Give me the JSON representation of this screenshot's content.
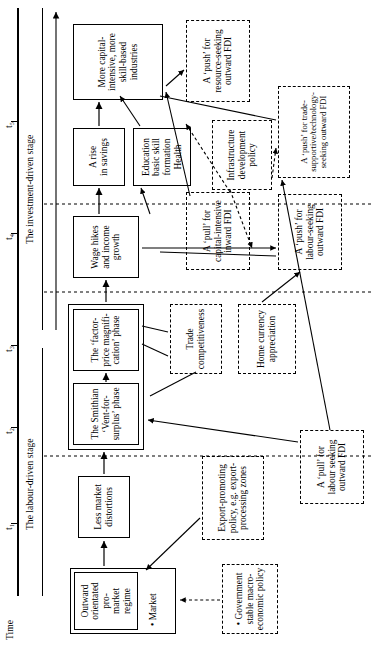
{
  "figure": {
    "axis_title": "Time",
    "ticks": [
      "t1",
      "t2",
      "t3",
      "t4",
      "t5"
    ],
    "tick_labels": [
      "t₁",
      "t₂",
      "t₃",
      "t₄",
      "t₅"
    ],
    "stages": [
      {
        "id": "labour",
        "label": "The labour-driven stage"
      },
      {
        "id": "investment",
        "label": "The investment-driven stage"
      }
    ]
  },
  "boxes": {
    "outward_regime": {
      "title": "Outward\norientated pro-\nmarket regime",
      "line1": "Outward",
      "line2": "orientated pro-",
      "line3": "market regime",
      "bullet": "• Market",
      "style": "solid-double"
    },
    "less_market_distortions": {
      "line1": "Less market",
      "line2": "distortions",
      "style": "solid"
    },
    "smithian": {
      "line1": "The Smithian",
      "line2": "‘Vent-for-",
      "line3": "surplus’ phase",
      "style": "solid"
    },
    "factor_price": {
      "line1": "The ‘factor-",
      "line2": "price magnifi-",
      "line3": "cation’ phase",
      "style": "solid"
    },
    "wage_hikes": {
      "line1": "Wage hikes",
      "line2": "and income",
      "line3": "growth",
      "style": "solid"
    },
    "rise_savings": {
      "line1": "A rise",
      "line2": "in savings",
      "style": "solid"
    },
    "education": {
      "line1": "Education",
      "line2": "basic skill",
      "line3": "formation",
      "line4": "Health",
      "style": "solid"
    },
    "more_capital": {
      "line1": "More capital-",
      "line2": "intensive, more",
      "line3": "skill-based",
      "line4": "industries",
      "style": "solid"
    },
    "government_policy": {
      "line1": "• Government",
      "line2": "stable macro-",
      "line3": "economic policy",
      "style": "dashed"
    },
    "export_promoting": {
      "line1": "Export-promoting",
      "line2": "policy, e.g. export-",
      "line3": "processing zones",
      "style": "dashed"
    },
    "trade_competitiveness": {
      "line1": "Trade",
      "line2": "competitiveness",
      "style": "dashed"
    },
    "home_currency": {
      "line1": "Home currency",
      "line2": "appreciation",
      "style": "dashed"
    },
    "infrastructure": {
      "line1": "Infrastructure",
      "line2": "development",
      "line3": "policy",
      "style": "dashed"
    },
    "pull_labour_seeking": {
      "line1": "A ‘pull’ for",
      "line2": "labour seeking",
      "line3": "outward FDI",
      "style": "dashed"
    },
    "push_labour_seeking": {
      "line1": "A ‘push’ for",
      "line2": "labour-seeking",
      "line3": "outward FDI",
      "style": "dashed"
    },
    "push_trade_supportive": {
      "line1": "A ‘push’ for trade-",
      "line2": "supportive/technology-",
      "line3": "seeking outward FDI",
      "style": "dashed"
    },
    "pull_capital_intensive": {
      "line1": "A ‘pull’ for",
      "line2": "capital-intensive",
      "line3": "inward FDI",
      "style": "dashed"
    },
    "push_resource_seeking": {
      "line1": "A ‘push’ for",
      "line2": "resource-seeking",
      "line3": "outward FDI",
      "style": "dashed"
    }
  },
  "colors": {
    "stroke": "#000000",
    "background": "#ffffff"
  }
}
